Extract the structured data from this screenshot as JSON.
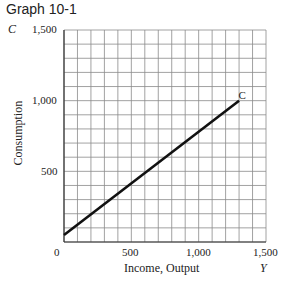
{
  "figure": {
    "title": "Graph 10-1",
    "y_axis_letter": "C",
    "x_axis_letter": "Y",
    "ylabel": "Consumption",
    "xlabel": "Income, Output",
    "curve_label": "C",
    "y_ticks": [
      "1,500",
      "1,000",
      "500"
    ],
    "x_ticks": [
      "0",
      "500",
      "1,000",
      "1,500"
    ]
  },
  "chart_data": {
    "type": "line",
    "title": "Graph 10-1",
    "xlabel": "Income, Output (Y)",
    "ylabel": "Consumption (C)",
    "xlim": [
      0,
      1500
    ],
    "ylim": [
      0,
      1500
    ],
    "x_ticks": [
      0,
      500,
      1000,
      1500
    ],
    "y_ticks": [
      500,
      1000,
      1500
    ],
    "grid": true,
    "grid_step": 100,
    "series": [
      {
        "name": "C",
        "x": [
          0,
          1300
        ],
        "y": [
          50,
          1000
        ],
        "color": "#111111"
      }
    ],
    "annotations": [
      {
        "text": "C",
        "x": 1310,
        "y": 1020
      }
    ]
  }
}
